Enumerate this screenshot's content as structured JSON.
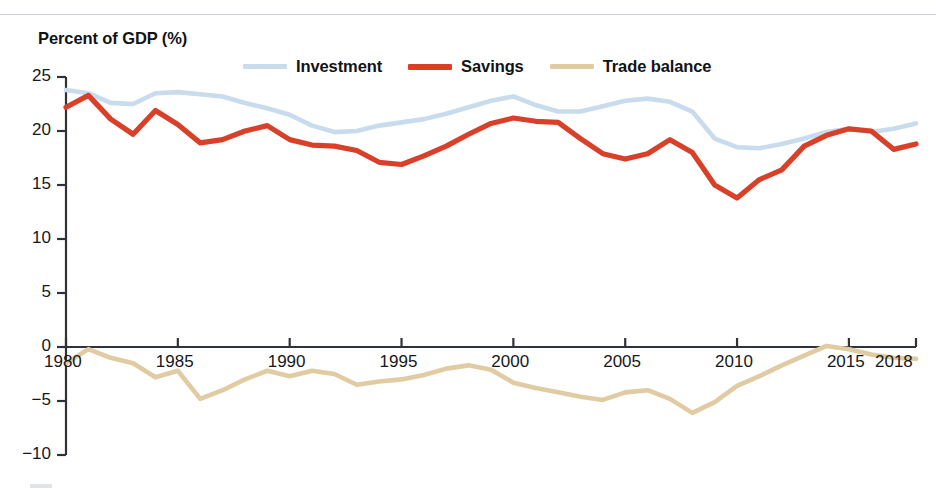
{
  "figure": {
    "axis_title": "Percent of GDP (%)"
  },
  "legend": {
    "position": "top-center",
    "items": [
      {
        "label": "Investment",
        "color": "#c8dced",
        "name": "investment"
      },
      {
        "label": "Savings",
        "color": "#d8402a",
        "name": "savings"
      },
      {
        "label": "Trade balance",
        "color": "#e0cba3",
        "name": "trade-balance"
      }
    ]
  },
  "colors": {
    "investment": "#c8dced",
    "savings": "#d8402a",
    "trade_balance": "#e0cba3",
    "axis": "#2f3338",
    "text": "#16181c",
    "top_rule": "#c9ccd4"
  },
  "chart_data": {
    "type": "line",
    "title": "",
    "subtitle": "",
    "xlabel": "",
    "ylabel": "Percent of GDP (%)",
    "grid": false,
    "legend_position": "top-center",
    "xlim": [
      1980,
      2018
    ],
    "ylim": [
      -10,
      25
    ],
    "xticks": [
      1980,
      1985,
      1990,
      1995,
      2000,
      2005,
      2010,
      2015,
      2018
    ],
    "xtick_labels": [
      "1980",
      "1985",
      "1990",
      "1995",
      "2000",
      "2005",
      "2010",
      "2015",
      "2018"
    ],
    "yticks": [
      25,
      20,
      15,
      10,
      5,
      0,
      -5,
      -10
    ],
    "ytick_labels": [
      "25",
      "20",
      "15",
      "10",
      "5",
      "0",
      "−5",
      "−10"
    ],
    "x": [
      1980,
      1981,
      1982,
      1983,
      1984,
      1985,
      1986,
      1987,
      1988,
      1989,
      1990,
      1991,
      1992,
      1993,
      1994,
      1995,
      1996,
      1997,
      1998,
      1999,
      2000,
      2001,
      2002,
      2003,
      2004,
      2005,
      2006,
      2007,
      2008,
      2009,
      2010,
      2011,
      2012,
      2013,
      2014,
      2015,
      2016,
      2017,
      2018
    ],
    "series": [
      {
        "name": "Investment",
        "color": "#c8dced",
        "values": [
          23.8,
          23.5,
          22.6,
          22.5,
          23.5,
          23.6,
          23.4,
          23.2,
          22.6,
          22.1,
          21.5,
          20.5,
          19.9,
          20.0,
          20.5,
          20.8,
          21.1,
          21.6,
          22.2,
          22.8,
          23.2,
          22.4,
          21.8,
          21.8,
          22.3,
          22.8,
          23.0,
          22.7,
          21.8,
          19.3,
          18.5,
          18.4,
          18.8,
          19.3,
          19.9,
          20.2,
          19.9,
          20.2,
          20.7
        ]
      },
      {
        "name": "Savings",
        "color": "#d8402a",
        "values": [
          22.2,
          23.3,
          21.1,
          19.7,
          21.9,
          20.6,
          18.9,
          19.2,
          20.0,
          20.5,
          19.2,
          18.7,
          18.6,
          18.2,
          17.1,
          16.9,
          17.7,
          18.6,
          19.7,
          20.7,
          21.2,
          20.9,
          20.8,
          19.3,
          17.9,
          17.4,
          17.9,
          19.2,
          18.0,
          15.0,
          13.8,
          15.5,
          16.4,
          18.6,
          19.6,
          20.2,
          20.0,
          18.3,
          18.8
        ]
      },
      {
        "name": "Trade balance",
        "color": "#e0cba3",
        "values": [
          -1.5,
          -0.2,
          -1.0,
          -1.5,
          -2.8,
          -2.2,
          -4.8,
          -4.0,
          -3.0,
          -2.2,
          -2.7,
          -2.2,
          -2.5,
          -3.5,
          -3.2,
          -3.0,
          -2.6,
          -2.0,
          -1.7,
          -2.1,
          -3.3,
          -3.8,
          -4.2,
          -4.6,
          -4.9,
          -4.2,
          -4.0,
          -4.8,
          -6.1,
          -5.1,
          -3.6,
          -2.7,
          -1.7,
          -0.8,
          0.1,
          -0.2,
          -0.7,
          -1.0,
          -1.1
        ]
      }
    ]
  }
}
